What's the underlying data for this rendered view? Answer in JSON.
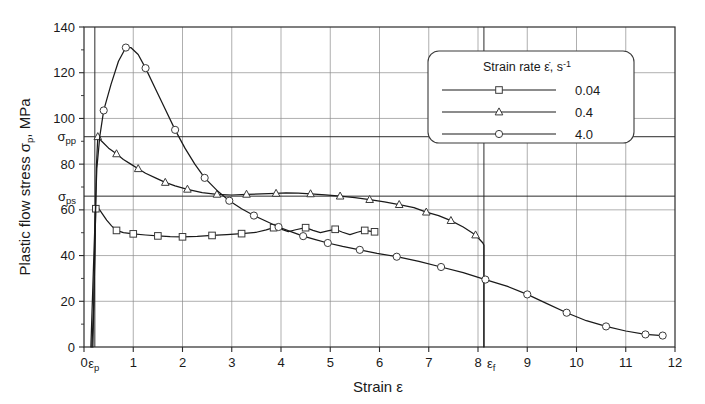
{
  "chart_data": {
    "type": "line",
    "title": "",
    "xlabel": "Strain ε",
    "ylabel": "Plastic flow stress σp, MPa",
    "xlim": [
      0,
      12
    ],
    "ylim": [
      0,
      140
    ],
    "grid": true,
    "legend_position": "top-right",
    "legend_title": "Strain rate ε̇, s⁻¹",
    "x_ticks": [
      "0",
      "1",
      "2",
      "3",
      "4",
      "5",
      "6",
      "7",
      "8",
      "9",
      "10",
      "11",
      "12"
    ],
    "y_ticks": [
      "0",
      "20",
      "40",
      "60",
      "80",
      "100",
      "120",
      "140"
    ],
    "annotations": [
      {
        "name": "epsilon-p",
        "label": "εp",
        "axis": "x",
        "value": 0.22,
        "note": "proportional-limit strain, vertical line"
      },
      {
        "name": "epsilon-f",
        "label": "εf",
        "axis": "x",
        "value": 8.12,
        "note": "failure strain, vertical line"
      },
      {
        "name": "sigma-pp",
        "label": "σpp",
        "axis": "y",
        "value": 92,
        "note": "peak plastic flow stress, horizontal line"
      },
      {
        "name": "sigma-ps",
        "label": "σps",
        "axis": "y",
        "value": 66,
        "note": "steady-state plastic flow stress, horizontal line"
      }
    ],
    "series": [
      {
        "name": "0.04",
        "label": "0.04",
        "marker": "square",
        "points": [
          [
            0.16,
            0.0
          ],
          [
            0.2,
            20.0
          ],
          [
            0.22,
            45.0
          ],
          [
            0.24,
            60.5
          ],
          [
            0.3,
            60.5
          ],
          [
            0.38,
            58.0
          ],
          [
            0.46,
            55.5
          ],
          [
            0.56,
            53.0
          ],
          [
            0.66,
            51.0
          ],
          [
            0.8,
            50.0
          ],
          [
            1.0,
            49.5
          ],
          [
            1.25,
            49.0
          ],
          [
            1.5,
            48.6
          ],
          [
            1.75,
            48.3
          ],
          [
            2.0,
            48.2
          ],
          [
            2.3,
            48.4
          ],
          [
            2.6,
            48.8
          ],
          [
            2.9,
            49.2
          ],
          [
            3.2,
            49.6
          ],
          [
            3.5,
            50.2
          ],
          [
            3.7,
            51.2
          ],
          [
            3.85,
            52.2
          ],
          [
            4.0,
            51.6
          ],
          [
            4.15,
            50.5
          ],
          [
            4.3,
            51.3
          ],
          [
            4.5,
            52.2
          ],
          [
            4.65,
            51.0
          ],
          [
            4.8,
            50.0
          ],
          [
            4.95,
            50.8
          ],
          [
            5.1,
            51.5
          ],
          [
            5.25,
            50.2
          ],
          [
            5.4,
            49.2
          ],
          [
            5.55,
            50.2
          ],
          [
            5.7,
            51.0
          ],
          [
            5.9,
            50.4
          ]
        ],
        "marker_points": [
          [
            0.24,
            60.5
          ],
          [
            0.66,
            51.0
          ],
          [
            1.0,
            49.5
          ],
          [
            1.5,
            48.6
          ],
          [
            2.0,
            48.2
          ],
          [
            2.6,
            48.8
          ],
          [
            3.2,
            49.6
          ],
          [
            3.85,
            52.2
          ],
          [
            4.5,
            52.2
          ],
          [
            5.1,
            51.5
          ],
          [
            5.7,
            51.0
          ],
          [
            5.9,
            50.4
          ]
        ]
      },
      {
        "name": "0.4",
        "label": "0.4",
        "marker": "triangle",
        "points": [
          [
            0.18,
            0.0
          ],
          [
            0.22,
            40.0
          ],
          [
            0.25,
            78.0
          ],
          [
            0.28,
            92.0
          ],
          [
            0.36,
            90.0
          ],
          [
            0.5,
            87.0
          ],
          [
            0.66,
            84.5
          ],
          [
            0.8,
            82.0
          ],
          [
            0.95,
            80.0
          ],
          [
            1.1,
            78.0
          ],
          [
            1.25,
            76.0
          ],
          [
            1.45,
            74.0
          ],
          [
            1.65,
            72.0
          ],
          [
            1.85,
            70.5
          ],
          [
            2.1,
            69.0
          ],
          [
            2.4,
            67.5
          ],
          [
            2.7,
            66.8
          ],
          [
            3.0,
            66.5
          ],
          [
            3.3,
            66.8
          ],
          [
            3.6,
            67.0
          ],
          [
            3.9,
            67.2
          ],
          [
            4.1,
            67.4
          ],
          [
            4.35,
            67.3
          ],
          [
            4.6,
            67.0
          ],
          [
            4.9,
            66.6
          ],
          [
            5.2,
            66.0
          ],
          [
            5.5,
            65.3
          ],
          [
            5.8,
            64.5
          ],
          [
            6.1,
            63.5
          ],
          [
            6.4,
            62.3
          ],
          [
            6.7,
            61.0
          ],
          [
            6.95,
            59.0
          ],
          [
            7.2,
            57.5
          ],
          [
            7.45,
            55.3
          ],
          [
            7.7,
            52.5
          ],
          [
            7.95,
            49.0
          ],
          [
            8.1,
            45.5
          ],
          [
            8.12,
            44.5
          ],
          [
            8.12,
            0.0
          ]
        ],
        "marker_points": [
          [
            0.28,
            92.0
          ],
          [
            0.66,
            84.5
          ],
          [
            1.1,
            78.0
          ],
          [
            1.65,
            72.0
          ],
          [
            2.1,
            69.0
          ],
          [
            2.7,
            66.8
          ],
          [
            3.3,
            66.8
          ],
          [
            3.9,
            67.2
          ],
          [
            4.6,
            67.0
          ],
          [
            5.2,
            66.0
          ],
          [
            5.8,
            64.5
          ],
          [
            6.4,
            62.3
          ],
          [
            6.95,
            59.0
          ],
          [
            7.45,
            55.3
          ],
          [
            7.95,
            49.0
          ]
        ]
      },
      {
        "name": "4.0",
        "label": "4.0",
        "marker": "circle",
        "points": [
          [
            0.14,
            0.0
          ],
          [
            0.2,
            40.0
          ],
          [
            0.26,
            78.0
          ],
          [
            0.32,
            92.0
          ],
          [
            0.4,
            103.5
          ],
          [
            0.55,
            115.0
          ],
          [
            0.7,
            125.0
          ],
          [
            0.85,
            131.0
          ],
          [
            0.95,
            131.0
          ],
          [
            1.1,
            128.0
          ],
          [
            1.25,
            122.0
          ],
          [
            1.45,
            113.0
          ],
          [
            1.65,
            104.0
          ],
          [
            1.85,
            95.0
          ],
          [
            2.05,
            87.0
          ],
          [
            2.25,
            80.0
          ],
          [
            2.45,
            74.0
          ],
          [
            2.7,
            68.5
          ],
          [
            2.95,
            64.0
          ],
          [
            3.2,
            60.5
          ],
          [
            3.45,
            57.5
          ],
          [
            3.7,
            55.0
          ],
          [
            3.95,
            52.5
          ],
          [
            4.2,
            50.5
          ],
          [
            4.45,
            48.5
          ],
          [
            4.7,
            47.0
          ],
          [
            4.95,
            45.5
          ],
          [
            5.25,
            44.0
          ],
          [
            5.6,
            42.5
          ],
          [
            5.95,
            41.0
          ],
          [
            6.35,
            39.5
          ],
          [
            6.8,
            37.5
          ],
          [
            7.25,
            35.0
          ],
          [
            7.7,
            32.5
          ],
          [
            8.15,
            29.5
          ],
          [
            8.6,
            26.5
          ],
          [
            9.0,
            23.0
          ],
          [
            9.4,
            19.0
          ],
          [
            9.8,
            15.0
          ],
          [
            10.2,
            11.5
          ],
          [
            10.6,
            9.0
          ],
          [
            11.0,
            7.0
          ],
          [
            11.4,
            5.5
          ],
          [
            11.75,
            5.0
          ]
        ],
        "marker_points": [
          [
            0.4,
            103.5
          ],
          [
            0.85,
            131.0
          ],
          [
            1.25,
            122.0
          ],
          [
            1.85,
            95.0
          ],
          [
            2.45,
            74.0
          ],
          [
            2.95,
            64.0
          ],
          [
            3.45,
            57.5
          ],
          [
            3.95,
            52.5
          ],
          [
            4.45,
            48.5
          ],
          [
            4.95,
            45.5
          ],
          [
            5.6,
            42.5
          ],
          [
            6.35,
            39.5
          ],
          [
            7.25,
            35.0
          ],
          [
            8.15,
            29.5
          ],
          [
            9.0,
            23.0
          ],
          [
            9.8,
            15.0
          ],
          [
            10.6,
            9.0
          ],
          [
            11.4,
            5.5
          ],
          [
            11.75,
            5.0
          ]
        ]
      }
    ]
  },
  "legend": {
    "title": "Strain rate ε̇, s⁻¹",
    "entries": [
      {
        "marker": "square",
        "value": "0.04"
      },
      {
        "marker": "triangle",
        "value": "0.4"
      },
      {
        "marker": "circle",
        "value": "4.0"
      }
    ]
  },
  "axes": {
    "x_title_main": "Strain",
    "x_title_symbol": "ε",
    "y_title_main": "Plastic flow stress",
    "y_title_symbol": "σ",
    "y_title_sub": "p",
    "y_title_unit": ", MPa",
    "x_tick_labels": [
      "0",
      "1",
      "2",
      "3",
      "4",
      "5",
      "6",
      "7",
      "8",
      "9",
      "10",
      "11",
      "12"
    ],
    "y_tick_labels": [
      "0",
      "20",
      "40",
      "60",
      "80",
      "100",
      "120",
      "140"
    ],
    "epsilon_p": "ε",
    "epsilon_p_sub": "p",
    "epsilon_f": "ε",
    "epsilon_f_sub": "f",
    "sigma_pp": "σ",
    "sigma_pp_sub": "pp",
    "sigma_ps": "σ",
    "sigma_ps_sub": "ps"
  }
}
